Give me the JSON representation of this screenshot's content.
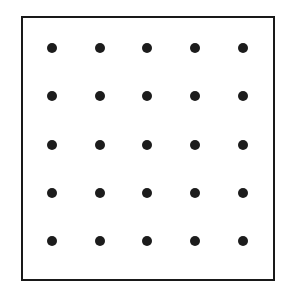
{
  "figure": {
    "name": "dot-grid-figure",
    "canvas_width": 290,
    "canvas_height": 292,
    "background_color": "#ffffff",
    "caption": ""
  },
  "frame": {
    "label": "rectangular-border",
    "x": 21,
    "y": 16,
    "width": 254,
    "height": 265,
    "border_width": 2,
    "border_color": "#1a1a1a",
    "fill_color": "#ffffff"
  },
  "grid": {
    "rows": 5,
    "columns": 5,
    "total_dots": 25,
    "dot_diameter": 10,
    "dot_color": "#1c1c1c",
    "column_spacing": 47.6,
    "row_spacing": 48.4,
    "column_centers_x": [
      52,
      100,
      147,
      195,
      243
    ],
    "row_centers_y": [
      48,
      96,
      145,
      193,
      241
    ],
    "dots": [
      {
        "row": 1,
        "col": 1,
        "x": 52,
        "y": 48
      },
      {
        "row": 1,
        "col": 2,
        "x": 100,
        "y": 48
      },
      {
        "row": 1,
        "col": 3,
        "x": 147,
        "y": 48
      },
      {
        "row": 1,
        "col": 4,
        "x": 195,
        "y": 48
      },
      {
        "row": 1,
        "col": 5,
        "x": 243,
        "y": 48
      },
      {
        "row": 2,
        "col": 1,
        "x": 52,
        "y": 96
      },
      {
        "row": 2,
        "col": 2,
        "x": 100,
        "y": 96
      },
      {
        "row": 2,
        "col": 3,
        "x": 147,
        "y": 96
      },
      {
        "row": 2,
        "col": 4,
        "x": 195,
        "y": 96
      },
      {
        "row": 2,
        "col": 5,
        "x": 243,
        "y": 96
      },
      {
        "row": 3,
        "col": 1,
        "x": 52,
        "y": 145
      },
      {
        "row": 3,
        "col": 2,
        "x": 100,
        "y": 145
      },
      {
        "row": 3,
        "col": 3,
        "x": 147,
        "y": 145
      },
      {
        "row": 3,
        "col": 4,
        "x": 195,
        "y": 145
      },
      {
        "row": 3,
        "col": 5,
        "x": 243,
        "y": 145
      },
      {
        "row": 4,
        "col": 1,
        "x": 52,
        "y": 193
      },
      {
        "row": 4,
        "col": 2,
        "x": 100,
        "y": 193
      },
      {
        "row": 4,
        "col": 3,
        "x": 147,
        "y": 193
      },
      {
        "row": 4,
        "col": 4,
        "x": 195,
        "y": 193
      },
      {
        "row": 4,
        "col": 5,
        "x": 243,
        "y": 193
      },
      {
        "row": 5,
        "col": 1,
        "x": 52,
        "y": 241
      },
      {
        "row": 5,
        "col": 2,
        "x": 100,
        "y": 241
      },
      {
        "row": 5,
        "col": 3,
        "x": 147,
        "y": 241
      },
      {
        "row": 5,
        "col": 4,
        "x": 195,
        "y": 241
      },
      {
        "row": 5,
        "col": 5,
        "x": 243,
        "y": 241
      }
    ]
  },
  "chart_data": {
    "type": "scatter",
    "title": "",
    "subtitle": "",
    "xlabel": "",
    "ylabel": "",
    "xlim": [
      21,
      275
    ],
    "ylim": [
      16,
      281
    ],
    "grid": false,
    "legend": null,
    "annotations": [],
    "xtick_labels": [],
    "ytick_labels": [],
    "series": [
      {
        "name": "dot-grid",
        "marker": "filled-circle",
        "marker_color": "#1c1c1c",
        "marker_size": 10,
        "x": [
          52,
          100,
          147,
          195,
          243,
          52,
          100,
          147,
          195,
          243,
          52,
          100,
          147,
          195,
          243,
          52,
          100,
          147,
          195,
          243,
          52,
          100,
          147,
          195,
          243
        ],
        "y": [
          48,
          48,
          48,
          48,
          48,
          96,
          96,
          96,
          96,
          96,
          145,
          145,
          145,
          145,
          145,
          193,
          193,
          193,
          193,
          193,
          241,
          241,
          241,
          241,
          241
        ]
      }
    ]
  }
}
